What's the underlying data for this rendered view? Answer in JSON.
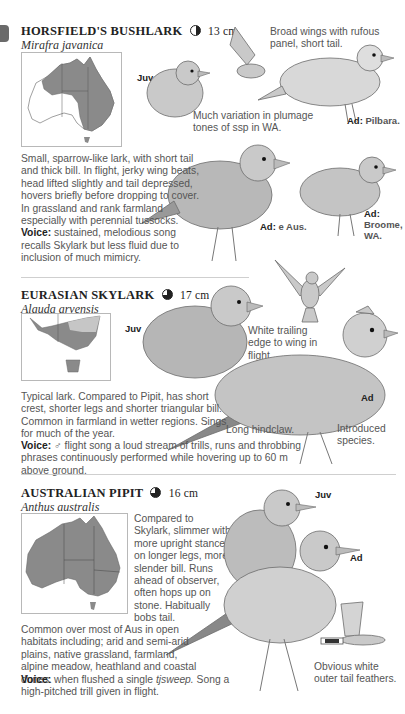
{
  "page": {
    "section_tab_color": "#6a6a6a",
    "species": [
      {
        "name": "HORSFIELD'S BUSHLARK",
        "status_icon": "half-filled-circle",
        "size": "13 cm",
        "scientific_name": "Mirafra javanica",
        "description": "Small, sparrow-like lark, with short tail and thick bill. In flight, jerky wing beats, head lifted slightly and tail depressed, hovers briefly before dropping to cover. In grassland and rank farmland especially with perennial tussocks.",
        "voice_label": "Voice:",
        "voice": "sustained, melodious song recalls Skylark but less fluid due to inclusion of much mimicry.",
        "notes": [
          "Broad wings with rufous panel, short tail.",
          "Much variation in plumage tones of ssp in WA."
        ],
        "illustration_labels": [
          {
            "bold": "Juv",
            "text": ""
          },
          {
            "bold": "Ad:",
            "text": "Pilbara."
          },
          {
            "bold": "Ad:",
            "text": "e Aus."
          },
          {
            "bold": "Ad:",
            "text": "Broome, WA."
          }
        ]
      },
      {
        "name": "EURASIAN SKYLARK",
        "status_icon": "three-quarter-filled-circle",
        "size": "17 cm",
        "scientific_name": "Alauda arvensis",
        "description": "Typical lark. Compared to Pipit, has short crest, shorter legs and shorter triangular bill. Common in farmland in wetter regions. Sings for much of the year.",
        "voice_label": "Voice:",
        "voice": "♂ flight song a loud stream of trills, runs and throbbing phrases continuously performed while hovering up to 60 m above ground.",
        "notes": [
          "White trailing edge to wing in flight.",
          "Long hindclaw.",
          "Introduced species."
        ],
        "illustration_labels": [
          {
            "bold": "Juv",
            "text": ""
          },
          {
            "bold": "Ad",
            "text": ""
          }
        ]
      },
      {
        "name": "AUSTRALIAN PIPIT",
        "status_icon": "three-quarter-filled-circle",
        "size": "16 cm",
        "scientific_name": "Anthus australis",
        "side_text": "Compared to Skylark, slimmer with more upright stance on longer legs, more slender bill. Runs ahead of observer, often hops up on stone. Habitually bobs tail.",
        "description": "Common over most of Aus in open habitats including; arid and semi-arid plains, native grassland, farmland, alpine meadow, heathland and coastal dunes.",
        "voice_label": "Voice:",
        "voice_pre": "when flushed a single",
        "voice_call": "tjsweep.",
        "voice_post": "Song a high-pitched trill given in flight.",
        "notes": [
          "Obvious white outer tail feathers."
        ],
        "illustration_labels": [
          {
            "bold": "Juv",
            "text": ""
          },
          {
            "bold": "Ad",
            "text": ""
          }
        ]
      }
    ]
  }
}
